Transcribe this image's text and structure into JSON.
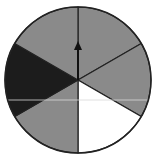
{
  "diagram": {
    "type": "spinner",
    "sectors": 6,
    "center": [
      78,
      80
    ],
    "radius": 73,
    "sector_fills": [
      {
        "name": "top-right",
        "color": "#8a8a8a"
      },
      {
        "name": "right",
        "color": "#8a8a8a"
      },
      {
        "name": "bottom-right",
        "color": "#ffffff"
      },
      {
        "name": "bottom-left",
        "color": "#8a8a8a"
      },
      {
        "name": "left",
        "color": "#1c1c1c"
      },
      {
        "name": "top-left",
        "color": "#8a8a8a"
      }
    ],
    "arrow": {
      "direction": "up",
      "color": "#111111"
    },
    "outline_color": "#222222"
  }
}
